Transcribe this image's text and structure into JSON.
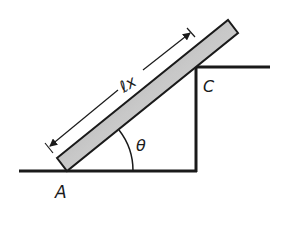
{
  "diagram": {
    "type": "physics-free-body-setup",
    "labels": {
      "point_a": "A",
      "point_c": "C",
      "angle": "θ",
      "length": "ℓx"
    },
    "colors": {
      "line": "#1a1a1a",
      "bar_light": "#d8d8d8",
      "bar_dark": "#9a9a9a",
      "background": "#ffffff"
    }
  }
}
